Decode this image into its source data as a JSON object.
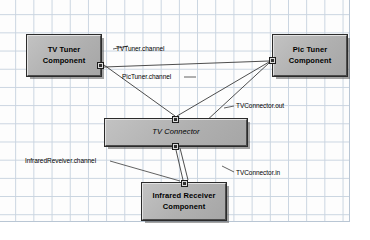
{
  "diagram": {
    "canvas": {
      "width": 370,
      "height": 240,
      "grid_visible": true,
      "grid_color": "#c9d4e0",
      "background_color": "#fdfdfd"
    },
    "style": {
      "node_fill": "#b5b5b5",
      "node_border": "#2b2b2b",
      "port_fill": "#d9d9d9",
      "wire_color": "#3a3a3a",
      "text_color": "#000000"
    },
    "nodes": [
      {
        "id": "tv-tuner",
        "label": "TV Tuner\nComponent",
        "line1": "TV Tuner",
        "line2": "Component",
        "kind": "component",
        "x": 27,
        "y": 35,
        "w": 74,
        "h": 41
      },
      {
        "id": "pic-tuner",
        "label": "Pic Tuner\nComponent",
        "line1": "Pic Tuner",
        "line2": "Component",
        "kind": "component",
        "x": 273,
        "y": 35,
        "w": 74,
        "h": 41
      },
      {
        "id": "tv-connector",
        "label": "TV Connector",
        "line1": "TV Connector",
        "line2": "",
        "kind": "connector",
        "x": 105,
        "y": 119,
        "w": 142,
        "h": 27
      },
      {
        "id": "infrared-receiver",
        "label": "Infrared Receiver\nComponent",
        "line1": "Infrared Receiver",
        "line2": "Component",
        "kind": "component",
        "x": 142,
        "y": 183,
        "w": 84,
        "h": 37
      }
    ],
    "ports": [
      {
        "id": "tv-tuner-port",
        "owner": "tv-tuner",
        "side": "right",
        "x": 97,
        "y": 62
      },
      {
        "id": "pic-tuner-port",
        "owner": "pic-tuner",
        "side": "left",
        "x": 269,
        "y": 57
      },
      {
        "id": "tv-connector-port-in",
        "owner": "tv-connector",
        "side": "top",
        "x": 172,
        "y": 116
      },
      {
        "id": "tv-connector-port-out",
        "owner": "tv-connector",
        "side": "bottom",
        "x": 172,
        "y": 143
      },
      {
        "id": "infrared-port",
        "owner": "infrared-receiver",
        "side": "top",
        "x": 181,
        "y": 180
      }
    ],
    "edge_labels": [
      {
        "id": "tvtuner-channel",
        "text": "TVTuner.channel",
        "x": 116,
        "y": 45
      },
      {
        "id": "pictuner-channel",
        "text": "PicTuner.channel",
        "x": 122,
        "y": 73
      },
      {
        "id": "tvconnector-out",
        "text": "TVConnector.out",
        "x": 236,
        "y": 102
      },
      {
        "id": "tvconnector-in",
        "text": "TVConnector.in",
        "x": 236,
        "y": 169
      },
      {
        "id": "infrared-channel",
        "text": "InfraredReveiver.channel",
        "x": 25,
        "y": 157
      }
    ],
    "connections": [
      {
        "id": "wire-tvtuner-to-tvconnector-top",
        "from": "tv-tuner-port",
        "to": "tv-connector-port-in",
        "label": "TVTuner.channel"
      },
      {
        "id": "wire-tvtuner-to-pictuner",
        "from": "tv-tuner-port",
        "to": "pic-tuner-port",
        "label": "PicTuner.channel"
      },
      {
        "id": "wire-tvconnector-top-to-pictuner",
        "from": "tv-connector-port-in",
        "to": "pic-tuner-port",
        "label": "TVConnector.out"
      },
      {
        "id": "wire-tvconnector-bot-to-pictuner",
        "from": "tv-connector-port-out",
        "to": "pic-tuner-port",
        "label": "TVConnector.in"
      },
      {
        "id": "wire-tvconnector-bot-to-infrared",
        "from": "tv-connector-port-out",
        "to": "infrared-port",
        "label": "InfraredReveiver.channel"
      }
    ],
    "leaders": [
      {
        "id": "leader-tvtuner-channel",
        "label_ref": "tvtuner-channel"
      },
      {
        "id": "leader-pictuner-channel",
        "label_ref": "pictuner-channel"
      },
      {
        "id": "leader-tvconnector-out",
        "label_ref": "tvconnector-out"
      },
      {
        "id": "leader-tvconnector-in",
        "label_ref": "tvconnector-in"
      },
      {
        "id": "leader-infrared-channel",
        "label_ref": "infrared-channel"
      }
    ]
  }
}
